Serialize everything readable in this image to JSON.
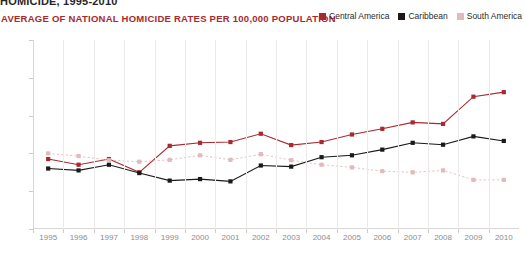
{
  "supertitle": "HOMICIDE, 1995-2010",
  "chart_title": "AVERAGE OF NATIONAL HOMICIDE RATES PER 100,000 POPULATION",
  "colors": {
    "central_america": "#A8292E",
    "caribbean": "#1A1A1A",
    "south_america": "#E2B9BC",
    "title": "#A8292E",
    "grid": "#ECEAEA",
    "axis": "#D9D6D6",
    "tick_text": "#8C8C8C"
  },
  "legend": {
    "position": "top-right",
    "items": [
      {
        "label": "Central America",
        "color": "#A8292E",
        "swatch": "square-swatch"
      },
      {
        "label": "Caribbean",
        "color": "#1A1A1A",
        "swatch": "square-swatch"
      },
      {
        "label": "South America",
        "color": "#E2B9BC",
        "swatch": "square-swatch"
      }
    ]
  },
  "chart_data": {
    "type": "line",
    "title": "AVERAGE OF NATIONAL HOMICIDE RATES PER 100,000 POPULATION",
    "subtitle": "HOMICIDE, 1995-2010",
    "xlabel": "",
    "ylabel": "",
    "grid": "vertical",
    "legend_position": "top-right",
    "xlim": [
      1995,
      2010
    ],
    "ylim": [
      0,
      50
    ],
    "yticks": [
      0,
      10,
      20,
      30,
      40,
      50
    ],
    "categories": [
      "1995",
      "1996",
      "1997",
      "1998",
      "1999",
      "2000",
      "2001",
      "2002",
      "2003",
      "2004",
      "2005",
      "2006",
      "2007",
      "2008",
      "2009",
      "2010"
    ],
    "series": [
      {
        "name": "Central America",
        "color": "#A8292E",
        "marker": "square",
        "line_style": "solid",
        "values": [
          18.5,
          17.0,
          18.5,
          15.0,
          22.0,
          22.8,
          23.0,
          25.2,
          22.2,
          23.0,
          25.0,
          26.5,
          28.2,
          27.8,
          35.0,
          36.2
        ]
      },
      {
        "name": "Caribbean",
        "color": "#1A1A1A",
        "marker": "square",
        "line_style": "solid",
        "values": [
          16.0,
          15.5,
          17.0,
          14.8,
          12.8,
          13.2,
          12.6,
          16.8,
          16.5,
          19.0,
          19.5,
          21.0,
          22.8,
          22.3,
          24.5,
          23.3
        ]
      },
      {
        "name": "South America",
        "color": "#E2B9BC",
        "marker": "square",
        "line_style": "dotted",
        "values": [
          20.0,
          19.3,
          18.2,
          17.8,
          18.3,
          19.5,
          18.3,
          19.8,
          18.2,
          17.0,
          16.3,
          15.3,
          15.0,
          15.5,
          13.0,
          13.0
        ]
      }
    ]
  }
}
